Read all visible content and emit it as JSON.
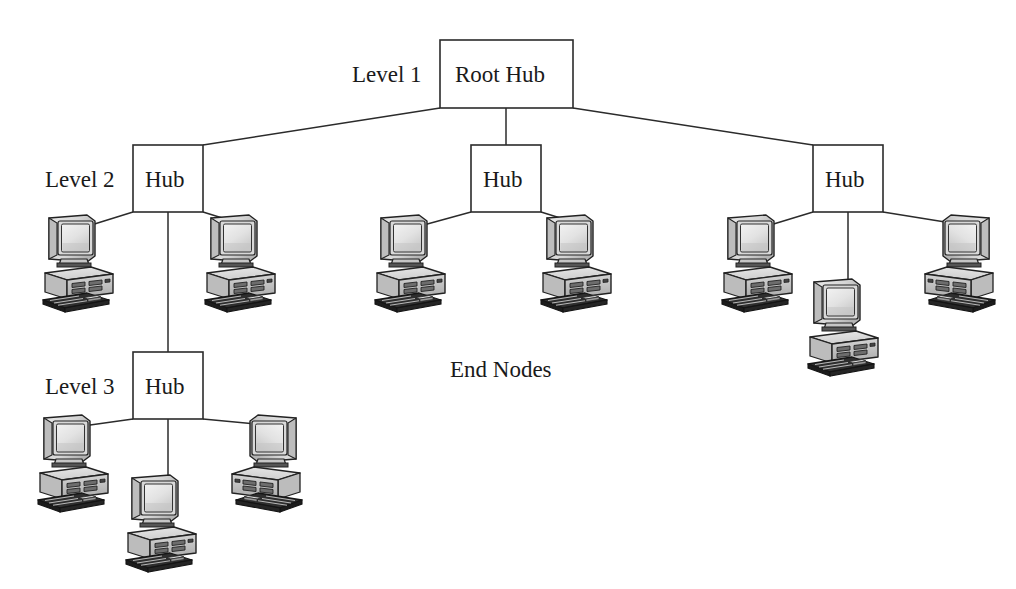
{
  "figure": {
    "background_color": "#ffffff",
    "line_color": "#2b2b2b",
    "text_color": "#1a1a1a"
  },
  "labels": {
    "level1": "Level 1",
    "level2": "Level 2",
    "level3": "Level 3",
    "end_nodes": "End Nodes"
  },
  "nodes": {
    "root_hub": {
      "label": "Root Hub",
      "x": 440,
      "y": 40,
      "w": 133,
      "h": 68
    },
    "hub_left": {
      "label": "Hub",
      "x": 133,
      "y": 145,
      "w": 70,
      "h": 67
    },
    "hub_center": {
      "label": "Hub",
      "x": 471,
      "y": 145,
      "w": 70,
      "h": 67
    },
    "hub_right": {
      "label": "Hub",
      "x": 813,
      "y": 145,
      "w": 70,
      "h": 67
    },
    "hub_level3": {
      "label": "Hub",
      "x": 133,
      "y": 352,
      "w": 70,
      "h": 67
    }
  },
  "end_nodes": [
    {
      "name": "pc-l2-left-a",
      "x": 43,
      "y": 214,
      "scale": 1.0,
      "mirrored": false
    },
    {
      "name": "pc-l2-left-b",
      "x": 205,
      "y": 214,
      "scale": 1.0,
      "mirrored": false
    },
    {
      "name": "pc-l2-center-a",
      "x": 375,
      "y": 214,
      "scale": 1.0,
      "mirrored": false
    },
    {
      "name": "pc-l2-center-b",
      "x": 541,
      "y": 214,
      "scale": 1.0,
      "mirrored": false
    },
    {
      "name": "pc-l2-right-a",
      "x": 722,
      "y": 214,
      "scale": 1.0,
      "mirrored": false
    },
    {
      "name": "pc-l2-right-b",
      "x": 925,
      "y": 214,
      "scale": 1.0,
      "mirrored": false
    },
    {
      "name": "pc-l2-right-c",
      "x": 808,
      "y": 278,
      "scale": 1.0,
      "mirrored": true
    },
    {
      "name": "pc-l3-left",
      "x": 38,
      "y": 414,
      "scale": 1.0,
      "mirrored": false
    },
    {
      "name": "pc-l3-right",
      "x": 232,
      "y": 414,
      "scale": 1.0,
      "mirrored": true
    },
    {
      "name": "pc-l3-center",
      "x": 126,
      "y": 474,
      "scale": 1.0,
      "mirrored": false
    }
  ],
  "edges": [
    {
      "from": "root_hub",
      "to": "hub_left",
      "kind": "diagonal"
    },
    {
      "from": "root_hub",
      "to": "hub_center",
      "kind": "vertical"
    },
    {
      "from": "root_hub",
      "to": "hub_right",
      "kind": "diagonal"
    },
    {
      "from": "hub_left",
      "to": "pc-l2-left-a",
      "kind": "diagonal"
    },
    {
      "from": "hub_left",
      "to": "pc-l2-left-b",
      "kind": "diagonal"
    },
    {
      "from": "hub_left",
      "to": "hub_level3",
      "kind": "vertical"
    },
    {
      "from": "hub_center",
      "to": "pc-l2-center-a",
      "kind": "diagonal"
    },
    {
      "from": "hub_center",
      "to": "pc-l2-center-b",
      "kind": "diagonal"
    },
    {
      "from": "hub_right",
      "to": "pc-l2-right-a",
      "kind": "diagonal"
    },
    {
      "from": "hub_right",
      "to": "pc-l2-right-b",
      "kind": "diagonal"
    },
    {
      "from": "hub_right",
      "to": "pc-l2-right-c",
      "kind": "vertical"
    },
    {
      "from": "hub_level3",
      "to": "pc-l3-left",
      "kind": "diagonal"
    },
    {
      "from": "hub_level3",
      "to": "pc-l3-right",
      "kind": "diagonal"
    },
    {
      "from": "hub_level3",
      "to": "pc-l3-center",
      "kind": "vertical"
    }
  ],
  "label_positions": {
    "level1": {
      "x": 352,
      "y": 63
    },
    "level2": {
      "x": 45,
      "y": 168
    },
    "level3": {
      "x": 45,
      "y": 375
    },
    "end_nodes": {
      "x": 450,
      "y": 358
    }
  }
}
